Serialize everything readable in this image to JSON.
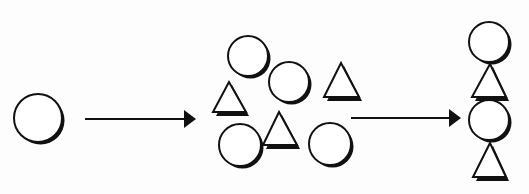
{
  "diagram": {
    "stroke_color": "#111111",
    "fill_color": "#ffffff",
    "stages": [
      {
        "name": "single-unit",
        "shapes": [
          {
            "type": "circle",
            "cx": 38,
            "cy": 118,
            "r": 24
          }
        ]
      },
      {
        "name": "disordered-mixture",
        "shapes": [
          {
            "type": "circle",
            "cx": 248,
            "cy": 56,
            "r": 20
          },
          {
            "type": "circle",
            "cx": 289,
            "cy": 82,
            "r": 20
          },
          {
            "type": "triangle",
            "apex": [
              229,
              82
            ],
            "base_left": [
              213,
              112
            ],
            "base_right": [
              246,
              112
            ]
          },
          {
            "type": "triangle",
            "apex": [
              341,
              63
            ],
            "base_left": [
              324,
              97
            ],
            "base_right": [
              359,
              97
            ]
          },
          {
            "type": "circle",
            "cx": 240,
            "cy": 145,
            "r": 21
          },
          {
            "type": "triangle",
            "apex": [
              279,
              112
            ],
            "base_left": [
              263,
              145
            ],
            "base_right": [
              297,
              145
            ]
          },
          {
            "type": "circle",
            "cx": 330,
            "cy": 144,
            "r": 21
          }
        ]
      },
      {
        "name": "ordered-stack",
        "shapes": [
          {
            "type": "circle",
            "cx": 489,
            "cy": 42,
            "r": 20
          },
          {
            "type": "triangle",
            "apex": [
              490,
              64
            ],
            "base_left": [
              472,
              97
            ],
            "base_right": [
              506,
              97
            ]
          },
          {
            "type": "circle",
            "cx": 489,
            "cy": 120,
            "r": 20
          },
          {
            "type": "triangle",
            "apex": [
              490,
              143
            ],
            "base_left": [
              473,
              177
            ],
            "base_right": [
              506,
              177
            ]
          }
        ]
      }
    ],
    "arrows": [
      {
        "name": "arrow-1",
        "x1": 85,
        "x2": 196,
        "y": 119
      },
      {
        "name": "arrow-2",
        "x1": 351,
        "x2": 461,
        "y": 118
      }
    ]
  }
}
